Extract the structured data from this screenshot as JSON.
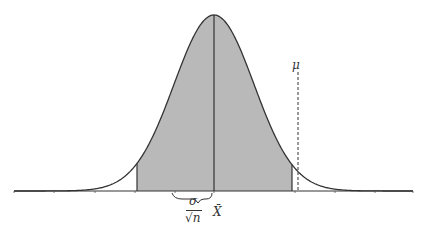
{
  "diagram": {
    "type": "normal-distribution-confidence-interval",
    "labels": {
      "mu": "μ",
      "sigma": "σ",
      "sqrt_n": "√n",
      "x_bar": "X̄"
    },
    "colors": {
      "shade": "#b9b9b9",
      "line": "#333333",
      "background": "#ffffff"
    },
    "geometry": {
      "peak_x": 214,
      "peak_y": 15,
      "baseline_y": 191,
      "shade_left_x": 137,
      "shade_right_x": 292,
      "mu_x": 298,
      "axis_left_x": 14,
      "axis_right_x": 413,
      "ticks_x": [
        14,
        54,
        95,
        135,
        175,
        214,
        295,
        335,
        375,
        413
      ]
    }
  }
}
